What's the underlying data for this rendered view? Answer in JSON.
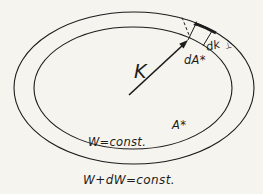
{
  "figure": {
    "colors": {
      "background": "#f6f4ef",
      "ink": "#1c1c1c"
    },
    "labels": {
      "k_vector": "K",
      "area_element": "dA*",
      "dk_perp": "dk",
      "dk_perp_sub": "⊥",
      "surface_area": "A*",
      "inner_surface": "W=const.",
      "outer_surface": "W+dW=const."
    }
  }
}
